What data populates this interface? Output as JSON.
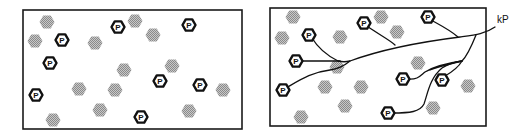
{
  "diagram": {
    "particle_label": "P",
    "output_label": "kP",
    "colors": {
      "ink": "#111111",
      "blob": "#9a9a9a",
      "background": "#ffffff"
    },
    "panels": [
      {
        "id": "left",
        "description": "Scattered P particles among gray hexagonal blobs (unconnected)",
        "frame": {
          "x": 23,
          "y": 10,
          "w": 219,
          "h": 119
        },
        "particles": [
          {
            "x": 62,
            "y": 40
          },
          {
            "x": 118,
            "y": 27
          },
          {
            "x": 189,
            "y": 25
          },
          {
            "x": 50,
            "y": 63
          },
          {
            "x": 160,
            "y": 81
          },
          {
            "x": 200,
            "y": 85
          },
          {
            "x": 36,
            "y": 95
          },
          {
            "x": 141,
            "y": 117
          }
        ],
        "blobs": [
          {
            "x": 47,
            "y": 22
          },
          {
            "x": 35,
            "y": 41
          },
          {
            "x": 95,
            "y": 43
          },
          {
            "x": 135,
            "y": 21
          },
          {
            "x": 153,
            "y": 35
          },
          {
            "x": 124,
            "y": 70
          },
          {
            "x": 172,
            "y": 66
          },
          {
            "x": 79,
            "y": 89
          },
          {
            "x": 115,
            "y": 90
          },
          {
            "x": 100,
            "y": 110
          },
          {
            "x": 53,
            "y": 120
          },
          {
            "x": 189,
            "y": 111
          },
          {
            "x": 223,
            "y": 90
          }
        ]
      },
      {
        "id": "right",
        "description": "P particles connected by branching paths that merge into a single output kP",
        "frame": {
          "x": 270,
          "y": 8,
          "w": 216,
          "h": 118
        },
        "particles": [
          {
            "x": 309,
            "y": 35
          },
          {
            "x": 364,
            "y": 23
          },
          {
            "x": 428,
            "y": 17
          },
          {
            "x": 296,
            "y": 61
          },
          {
            "x": 283,
            "y": 90
          },
          {
            "x": 403,
            "y": 79
          },
          {
            "x": 442,
            "y": 80
          },
          {
            "x": 388,
            "y": 113
          }
        ],
        "blobs": [
          {
            "x": 293,
            "y": 17
          },
          {
            "x": 282,
            "y": 38
          },
          {
            "x": 340,
            "y": 37
          },
          {
            "x": 381,
            "y": 17
          },
          {
            "x": 397,
            "y": 32
          },
          {
            "x": 337,
            "y": 67
          },
          {
            "x": 418,
            "y": 63
          },
          {
            "x": 325,
            "y": 87
          },
          {
            "x": 361,
            "y": 87
          },
          {
            "x": 345,
            "y": 106
          },
          {
            "x": 301,
            "y": 117
          },
          {
            "x": 433,
            "y": 108
          },
          {
            "x": 468,
            "y": 86
          }
        ],
        "output_label_position": {
          "x": 497,
          "y": 23
        }
      }
    ]
  }
}
